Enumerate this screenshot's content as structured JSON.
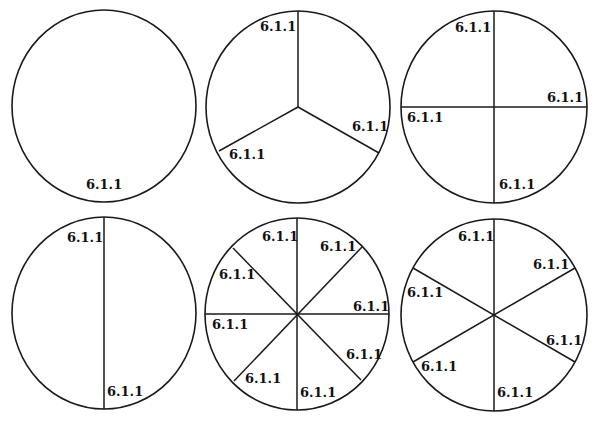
{
  "diagrams": [
    {
      "name": "circle-whole",
      "parts": 1,
      "cx": 104,
      "cy": 106,
      "rx": 92,
      "ry": 96,
      "lines": [],
      "labels": [
        {
          "text": "6.1.1",
          "x": 86,
          "y": 189
        }
      ]
    },
    {
      "name": "circle-thirds",
      "parts": 3,
      "cx": 298,
      "cy": 107,
      "rx": 92,
      "ry": 96,
      "lines": [
        [
          298,
          107,
          298,
          11
        ],
        [
          298,
          107,
          379,
          153
        ],
        [
          298,
          107,
          219,
          151
        ]
      ],
      "labels": [
        {
          "text": "6.1.1",
          "x": 260,
          "y": 31
        },
        {
          "text": "6.1.1",
          "x": 352,
          "y": 131
        },
        {
          "text": "6.1.1",
          "x": 229,
          "y": 159
        }
      ]
    },
    {
      "name": "circle-quarters",
      "parts": 4,
      "cx": 494,
      "cy": 107,
      "rx": 93,
      "ry": 96,
      "lines": [
        [
          494,
          11,
          494,
          203
        ],
        [
          401,
          107,
          587,
          107
        ]
      ],
      "labels": [
        {
          "text": "6.1.1",
          "x": 455,
          "y": 32
        },
        {
          "text": "6.1.1",
          "x": 547,
          "y": 102
        },
        {
          "text": "6.1.1",
          "x": 407,
          "y": 122
        },
        {
          "text": "6.1.1",
          "x": 499,
          "y": 189
        }
      ]
    },
    {
      "name": "circle-halves",
      "parts": 2,
      "cx": 104,
      "cy": 313,
      "rx": 92,
      "ry": 96,
      "lines": [
        [
          104,
          217,
          104,
          409
        ]
      ],
      "labels": [
        {
          "text": "6.1.1",
          "x": 67,
          "y": 242
        },
        {
          "text": "6.1.1",
          "x": 107,
          "y": 396
        }
      ]
    },
    {
      "name": "circle-eighths",
      "parts": 8,
      "cx": 297,
      "cy": 314,
      "rx": 92,
      "ry": 96,
      "lines": [
        [
          297,
          218,
          297,
          410
        ],
        [
          205,
          314,
          389,
          314
        ],
        [
          233,
          248,
          361,
          380
        ],
        [
          234,
          381,
          362,
          247
        ]
      ],
      "labels": [
        {
          "text": "6.1.1",
          "x": 262,
          "y": 241
        },
        {
          "text": "6.1.1",
          "x": 320,
          "y": 251
        },
        {
          "text": "6.1.1",
          "x": 219,
          "y": 279
        },
        {
          "text": "6.1.1",
          "x": 353,
          "y": 311
        },
        {
          "text": "6.1.1",
          "x": 212,
          "y": 329
        },
        {
          "text": "6.1.1",
          "x": 346,
          "y": 359
        },
        {
          "text": "6.1.1",
          "x": 245,
          "y": 383
        },
        {
          "text": "6.1.1",
          "x": 300,
          "y": 397
        }
      ]
    },
    {
      "name": "circle-sixths",
      "parts": 6,
      "cx": 494,
      "cy": 315,
      "rx": 93,
      "ry": 96,
      "lines": [
        [
          494,
          219,
          494,
          411
        ],
        [
          413,
          268,
          575,
          362
        ],
        [
          413,
          362,
          575,
          268
        ]
      ],
      "labels": [
        {
          "text": "6.1.1",
          "x": 458,
          "y": 241
        },
        {
          "text": "6.1.1",
          "x": 533,
          "y": 269
        },
        {
          "text": "6.1.1",
          "x": 407,
          "y": 297
        },
        {
          "text": "6.1.1",
          "x": 546,
          "y": 345
        },
        {
          "text": "6.1.1",
          "x": 421,
          "y": 371
        },
        {
          "text": "6.1.1",
          "x": 497,
          "y": 397
        }
      ]
    }
  ]
}
